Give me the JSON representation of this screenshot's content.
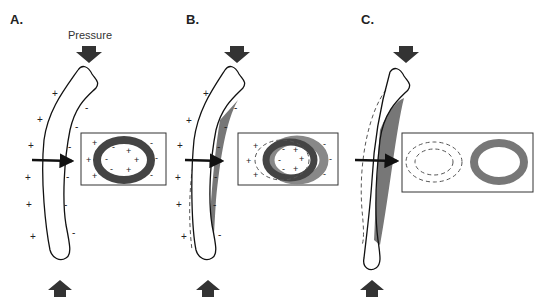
{
  "figure": {
    "panels": [
      {
        "id": "A",
        "label": "A.",
        "pressure_label": "Pressure",
        "description": "Bone under axial pressure with surface charges; cross-section ring with + outside and - inside on compressed side"
      },
      {
        "id": "B",
        "label": "B.",
        "description": "Bone bending with bone deposition on concave side; dashed outline shows original shape; cross-section shows shifted ring"
      },
      {
        "id": "C",
        "label": "C.",
        "description": "Remodeled bone; dashed outline shows original position; cross-section shows original (dashed) and new ring"
      }
    ],
    "charge_symbols": {
      "positive": "+",
      "negative": "-"
    },
    "colors": {
      "outline": "#111111",
      "arrow": "#333333",
      "ring": "#555555",
      "ring_light": "#888888",
      "deposit": "#777777",
      "dashed": "#555555"
    }
  }
}
